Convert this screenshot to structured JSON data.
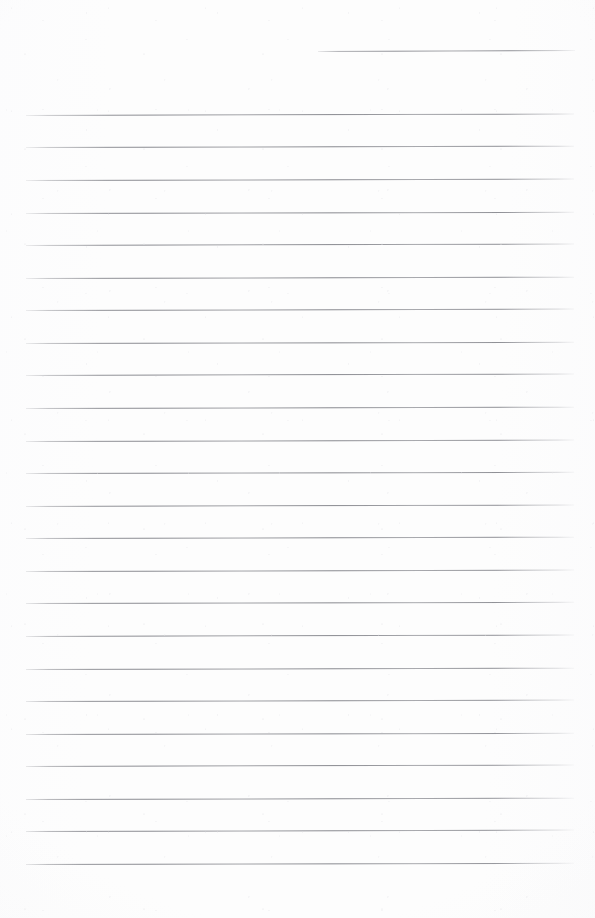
{
  "document": {
    "kind": "scanned-ruled-notebook-page",
    "title": "Ruled Paper Scan",
    "page_width": 595,
    "page_height": 918,
    "paper_color": "#fdfdfd",
    "rule_color": "#8c8d93",
    "rule_thickness": 1,
    "rule_spacing": 32.5,
    "content_text": "",
    "has_margin_rule": false,
    "has_handwriting": false,
    "rule_count": 25
  },
  "rules": [
    {
      "name": "rule-top-partial",
      "x": 318,
      "y": 51,
      "width": 257,
      "tilt": -0.22,
      "partial": true
    },
    {
      "name": "rule-01",
      "x": 26,
      "y": 115,
      "width": 548,
      "tilt": -0.16,
      "partial": false
    },
    {
      "name": "rule-02",
      "x": 26,
      "y": 147,
      "width": 548,
      "tilt": -0.14,
      "partial": false
    },
    {
      "name": "rule-03",
      "x": 26,
      "y": 180,
      "width": 548,
      "tilt": -0.15,
      "partial": false
    },
    {
      "name": "rule-04",
      "x": 26,
      "y": 213,
      "width": 548,
      "tilt": -0.13,
      "partial": false
    },
    {
      "name": "rule-05",
      "x": 26,
      "y": 245,
      "width": 548,
      "tilt": -0.16,
      "partial": false
    },
    {
      "name": "rule-06",
      "x": 26,
      "y": 278,
      "width": 548,
      "tilt": -0.14,
      "partial": false
    },
    {
      "name": "rule-07",
      "x": 26,
      "y": 310,
      "width": 548,
      "tilt": -0.15,
      "partial": false
    },
    {
      "name": "rule-08",
      "x": 26,
      "y": 343,
      "width": 548,
      "tilt": -0.13,
      "partial": false
    },
    {
      "name": "rule-09",
      "x": 26,
      "y": 375,
      "width": 548,
      "tilt": -0.16,
      "partial": false
    },
    {
      "name": "rule-10",
      "x": 26,
      "y": 408,
      "width": 548,
      "tilt": -0.14,
      "partial": false
    },
    {
      "name": "rule-11",
      "x": 26,
      "y": 441,
      "width": 548,
      "tilt": -0.15,
      "partial": false
    },
    {
      "name": "rule-12",
      "x": 26,
      "y": 473,
      "width": 548,
      "tilt": -0.13,
      "partial": false
    },
    {
      "name": "rule-13",
      "x": 26,
      "y": 506,
      "width": 548,
      "tilt": -0.16,
      "partial": false
    },
    {
      "name": "rule-14",
      "x": 26,
      "y": 538,
      "width": 548,
      "tilt": -0.14,
      "partial": false
    },
    {
      "name": "rule-15",
      "x": 26,
      "y": 571,
      "width": 548,
      "tilt": -0.15,
      "partial": false
    },
    {
      "name": "rule-16",
      "x": 26,
      "y": 603,
      "width": 548,
      "tilt": -0.13,
      "partial": false
    },
    {
      "name": "rule-17",
      "x": 26,
      "y": 636,
      "width": 548,
      "tilt": -0.16,
      "partial": false
    },
    {
      "name": "rule-18",
      "x": 26,
      "y": 669,
      "width": 548,
      "tilt": -0.14,
      "partial": false
    },
    {
      "name": "rule-19",
      "x": 26,
      "y": 701,
      "width": 548,
      "tilt": -0.15,
      "partial": false
    },
    {
      "name": "rule-20",
      "x": 26,
      "y": 734,
      "width": 548,
      "tilt": -0.13,
      "partial": false
    },
    {
      "name": "rule-21",
      "x": 26,
      "y": 766,
      "width": 548,
      "tilt": -0.16,
      "partial": false
    },
    {
      "name": "rule-22",
      "x": 26,
      "y": 799,
      "width": 548,
      "tilt": -0.14,
      "partial": false
    },
    {
      "name": "rule-23",
      "x": 26,
      "y": 831,
      "width": 548,
      "tilt": -0.15,
      "partial": false
    },
    {
      "name": "rule-24",
      "x": 26,
      "y": 864,
      "width": 548,
      "tilt": -0.13,
      "partial": false
    }
  ]
}
